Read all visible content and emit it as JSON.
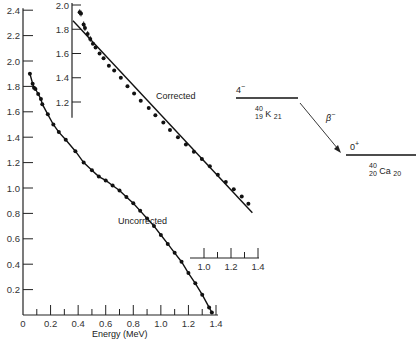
{
  "chart_data": [
    {
      "type": "scatter",
      "title": "",
      "xlabel": "Energy (MeV)",
      "ylabel": "",
      "xlim": [
        0,
        1.4
      ],
      "ylim": [
        0,
        2.4
      ],
      "x_ticks": [
        "0",
        "0.2",
        "0.4",
        "0.6",
        "0.8",
        "1.0",
        "1.2",
        "1.4"
      ],
      "y_ticks": [
        "0.2",
        "0.4",
        "0.6",
        "0.8",
        "1.0",
        "1.2",
        "1.4",
        "1.6",
        "1.8",
        "2.0",
        "2.2",
        "2.4"
      ],
      "grid": false,
      "series": [
        {
          "name": "Uncorrected",
          "x": [
            0.05,
            0.07,
            0.08,
            0.09,
            0.11,
            0.13,
            0.14,
            0.18,
            0.22,
            0.26,
            0.31,
            0.38,
            0.44,
            0.5,
            0.55,
            0.6,
            0.65,
            0.7,
            0.75,
            0.8,
            0.85,
            0.9,
            0.95,
            1.0,
            1.05,
            1.1,
            1.15,
            1.2,
            1.25,
            1.3,
            1.35,
            1.37
          ],
          "y": [
            1.9,
            1.82,
            1.79,
            1.78,
            1.74,
            1.7,
            1.66,
            1.58,
            1.5,
            1.44,
            1.38,
            1.29,
            1.2,
            1.14,
            1.09,
            1.06,
            1.02,
            0.98,
            0.93,
            0.88,
            0.82,
            0.76,
            0.7,
            0.63,
            0.56,
            0.49,
            0.42,
            0.33,
            0.25,
            0.16,
            0.06,
            0.02
          ]
        }
      ],
      "annotations": [
        "Uncorrected"
      ]
    },
    {
      "type": "scatter",
      "title": "Corrected (inset)",
      "xlabel": "",
      "ylabel": "",
      "xlim": [
        0.0,
        1.4
      ],
      "ylim": [
        1.1,
        2.0
      ],
      "x_ticks": [
        "1.0",
        "1.2",
        "1.4"
      ],
      "y_ticks": [
        "1.2",
        "1.4",
        "1.6",
        "1.8",
        "2.0"
      ],
      "grid": false,
      "series": [
        {
          "name": "Corrected",
          "x": [
            0.05,
            0.06,
            0.08,
            0.09,
            0.11,
            0.13,
            0.15,
            0.17,
            0.2,
            0.23,
            0.27,
            0.31,
            0.36,
            0.41,
            0.46,
            0.51,
            0.57,
            0.62,
            0.68,
            0.73,
            0.79,
            0.85,
            0.91,
            0.97,
            1.03,
            1.09,
            1.15,
            1.21,
            1.27,
            1.32
          ],
          "y": [
            1.94,
            1.93,
            1.84,
            1.81,
            1.76,
            1.72,
            1.68,
            1.65,
            1.6,
            1.56,
            1.5,
            1.46,
            1.4,
            1.33,
            1.27,
            1.21,
            1.15,
            1.09,
            1.03,
            0.97,
            0.91,
            0.85,
            0.79,
            0.73,
            0.67,
            0.6,
            0.54,
            0.48,
            0.42,
            0.36
          ]
        }
      ],
      "fit_line": {
        "x0": 0.0,
        "y0": 1.87,
        "x1": 1.35,
        "y1": 0.32
      },
      "annotations": [
        "Corrected"
      ]
    }
  ],
  "labels": {
    "x_axis_title": "Energy (MeV)",
    "uncorrected": "Uncorrected",
    "corrected": "Corrected"
  },
  "decay_scheme": {
    "parent_spin": "4",
    "parent_parity": "−",
    "parent_nuclide": {
      "mass": "40",
      "z": "19",
      "symbol": "K",
      "n": "21"
    },
    "decay_label": "β",
    "decay_sign": "−",
    "daughter_spin": "0",
    "daughter_parity": "+",
    "daughter_nuclide": {
      "mass": "40",
      "z": "20",
      "symbol": "Ca",
      "n": "20"
    }
  }
}
